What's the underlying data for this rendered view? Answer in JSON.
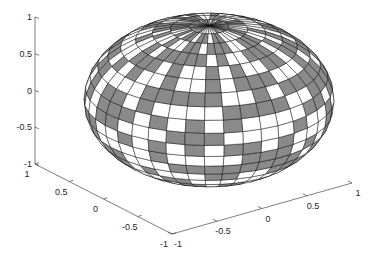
{
  "chart_data": {
    "type": "surface3d",
    "title": "",
    "surface": {
      "shape": "ellipsoid",
      "center": [
        0,
        0,
        0
      ],
      "radii": [
        1,
        1,
        1
      ],
      "n_theta": 40,
      "n_phi": 20,
      "face_colors": [
        "#8a8a8a",
        "#ffffff"
      ],
      "edge_color": "#000000"
    },
    "axes": {
      "x": {
        "label": "",
        "lim": [
          -1,
          1
        ],
        "ticks": [
          -1,
          -0.5,
          0,
          0.5,
          1
        ],
        "tick_labels": [
          "-1",
          "-0.5",
          "0",
          "0.5",
          "1"
        ]
      },
      "y": {
        "label": "",
        "lim": [
          -1,
          1
        ],
        "ticks": [
          -1,
          -0.5,
          0,
          0.5,
          1
        ],
        "tick_labels": [
          "-1",
          "-0.5",
          "0",
          "0.5",
          "1"
        ]
      },
      "z": {
        "label": "",
        "lim": [
          -1,
          1
        ],
        "ticks": [
          -1,
          -0.5,
          0,
          0.5,
          1
        ],
        "tick_labels": [
          "-1",
          "-0.5",
          "0",
          "0.5",
          "1"
        ]
      },
      "grid": false,
      "box": false
    },
    "legend": null
  },
  "layout": {
    "z_axis": {
      "x": 35,
      "y_top": 17,
      "y_bottom": 164
    },
    "y_axis": {
      "from": [
        35,
        164
      ],
      "to": [
        172,
        234
      ]
    },
    "x_axis": {
      "from": [
        172,
        234
      ],
      "to": [
        352,
        183
      ]
    },
    "sphere_center": [
      209,
      100
    ],
    "sphere_radii_px": [
      125,
      87
    ],
    "pole_top": [
      195,
      27
    ]
  }
}
